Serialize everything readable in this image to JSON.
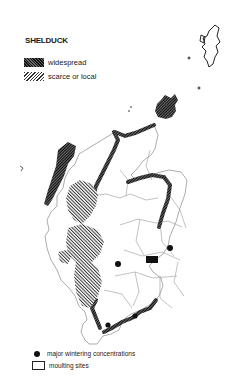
{
  "map": {
    "title": "SHELDUCK",
    "legend": {
      "widespread": "widespread",
      "scarce": "scarce or local",
      "wintering": "major wintering concentrations",
      "moulting": "moulting sites"
    },
    "colors": {
      "ink": "#111111",
      "boundary": "#888888",
      "background": "#ffffff"
    }
  }
}
